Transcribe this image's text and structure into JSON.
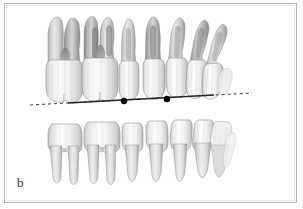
{
  "figure": {
    "panel_label": "b",
    "caption_text": "",
    "background_color": "#ffffff",
    "border_color": "#b4b4b4",
    "inner_border_color": "#e8e8e8"
  },
  "annotation": {
    "occlusal_line": {
      "name": "occlusal-plane-line",
      "style": "dashed",
      "color": "#3a3a3a",
      "x_start": 30,
      "y_start": 105,
      "x_end": 252,
      "y_end": 93,
      "dash_pattern": "3 3"
    },
    "solid_segment": {
      "name": "occlusal-solid-segment",
      "color": "#222222",
      "x_start": 68,
      "y_start": 103,
      "x_end": 214,
      "y_end": 95
    },
    "landmark_points": [
      {
        "label": "",
        "cx": 124,
        "cy": 101,
        "r": 3.2,
        "color": "#000000"
      },
      {
        "label": "",
        "cx": 167,
        "cy": 99,
        "r": 3.2,
        "color": "#000000"
      }
    ]
  },
  "anatomy": {
    "view": "lateral dentition, left-side posterior to right-side anterior",
    "arches": [
      {
        "name": "maxillary-arch",
        "position": "upper",
        "root_direction": "up",
        "teeth": [
          {
            "id": "u-molar-1",
            "type": "molar",
            "crown_x": 60,
            "crown_y": 78,
            "crown_w": 30,
            "roots": 3
          },
          {
            "id": "u-molar-2",
            "type": "molar",
            "crown_x": 95,
            "crown_y": 78,
            "crown_w": 30,
            "roots": 3
          },
          {
            "id": "u-premolar-1",
            "type": "premolar",
            "crown_x": 128,
            "crown_y": 80,
            "crown_w": 20,
            "roots": 1
          },
          {
            "id": "u-premolar-2",
            "type": "premolar",
            "crown_x": 152,
            "crown_y": 79,
            "crown_w": 20,
            "roots": 1
          },
          {
            "id": "u-canine",
            "type": "canine",
            "crown_x": 176,
            "crown_y": 78,
            "crown_w": 19,
            "roots": 1
          },
          {
            "id": "u-incisor-1",
            "type": "incisor",
            "crown_x": 197,
            "crown_y": 80,
            "crown_w": 17,
            "roots": 1
          },
          {
            "id": "u-incisor-2",
            "type": "incisor",
            "crown_x": 214,
            "crown_y": 83,
            "crown_w": 16,
            "roots": 1
          }
        ]
      },
      {
        "name": "mandibular-arch",
        "position": "lower",
        "root_direction": "down",
        "teeth": [
          {
            "id": "l-molar-1",
            "type": "molar",
            "crown_x": 62,
            "crown_y": 122,
            "crown_w": 29,
            "roots": 2
          },
          {
            "id": "l-molar-2",
            "type": "molar",
            "crown_x": 97,
            "crown_y": 122,
            "crown_w": 31,
            "roots": 2
          },
          {
            "id": "l-premolar-1",
            "type": "premolar",
            "crown_x": 131,
            "crown_y": 122,
            "crown_w": 21,
            "roots": 1
          },
          {
            "id": "l-premolar-2",
            "type": "premolar",
            "crown_x": 155,
            "crown_y": 122,
            "crown_w": 21,
            "roots": 1
          },
          {
            "id": "l-canine",
            "type": "canine",
            "crown_x": 180,
            "crown_y": 122,
            "crown_w": 20,
            "roots": 1
          },
          {
            "id": "l-incisor-1",
            "type": "incisor",
            "crown_x": 201,
            "crown_y": 122,
            "crown_w": 17,
            "roots": 1
          },
          {
            "id": "l-incisor-2",
            "type": "incisor",
            "crown_x": 217,
            "crown_y": 124,
            "crown_w": 16,
            "roots": 1
          }
        ]
      }
    ],
    "colors": {
      "enamel": "#f4f4f4",
      "enamel_shadow": "#d8d8d8",
      "dentin": "#cfcfcf",
      "root_shade": "#a8a8a8",
      "outline": "#8f8f8f",
      "deep_shadow": "#6e6e6e"
    }
  }
}
